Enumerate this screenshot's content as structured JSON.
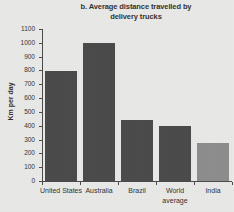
{
  "chart_data": {
    "type": "bar",
    "title": "b. Average distance travelled by delivery trucks",
    "title_line1": "b. Average distance travelled by",
    "title_line2": "delivery trucks",
    "xlabel": "",
    "ylabel": "Km per day",
    "ylim": [
      0,
      1100
    ],
    "ytick_step": 100,
    "grid": false,
    "legend": "none",
    "categories": [
      "United States",
      "Australia",
      "Brazil",
      "World average",
      "India"
    ],
    "values": [
      795,
      1000,
      445,
      400,
      275
    ],
    "ytick_labels": [
      "0",
      "100",
      "200",
      "300",
      "400",
      "500",
      "600",
      "700",
      "800",
      "900",
      "1000",
      "1100"
    ],
    "bars": [
      {
        "label": "United States",
        "label_line1": "United States",
        "label_line2": "",
        "value": 795,
        "color": "#4a4a4a"
      },
      {
        "label": "Australia",
        "label_line1": "Australia",
        "label_line2": "",
        "value": 1000,
        "color": "#4a4a4a"
      },
      {
        "label": "Brazil",
        "label_line1": "Brazil",
        "label_line2": "",
        "value": 445,
        "color": "#4a4a4a"
      },
      {
        "label": "World average",
        "label_line1": "World",
        "label_line2": "average",
        "value": 400,
        "color": "#4a4a4a"
      },
      {
        "label": "India",
        "label_line1": "India",
        "label_line2": "",
        "value": 275,
        "color": "#8d8d8d"
      }
    ],
    "colors": {
      "bar_dark": "#4a4a4a",
      "bar_light": "#8d8d8d",
      "axis": "#4b4b4b",
      "background": "#e9e9e7",
      "text": "#33312f"
    }
  }
}
